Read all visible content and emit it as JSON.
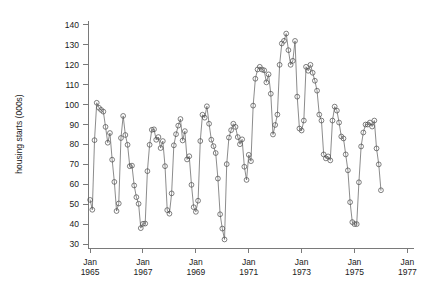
{
  "chart_data": {
    "type": "line",
    "title": "",
    "xlabel": "",
    "ylabel": "housing starts (000s)",
    "ylim": [
      28,
      142
    ],
    "yticks": [
      30,
      40,
      50,
      60,
      70,
      80,
      90,
      100,
      110,
      120,
      130,
      140
    ],
    "ytick_labels": [
      "30",
      "40",
      "50",
      "60",
      "70",
      "80",
      "90",
      "100",
      "110",
      "120",
      "130",
      "140"
    ],
    "xlim": [
      1964.92,
      1977.25
    ],
    "xticks": [
      1965.0,
      1967.0,
      1969.0,
      1971.0,
      1973.0,
      1975.0,
      1977.0
    ],
    "xtick_labels": [
      [
        "Jan",
        "1965"
      ],
      [
        "Jan",
        "1967"
      ],
      [
        "Jan",
        "1969"
      ],
      [
        "Jan",
        "1971"
      ],
      [
        "Jan",
        "1973"
      ],
      [
        "Jan",
        "1975"
      ],
      [
        "Jan",
        "1977"
      ]
    ],
    "grid": false,
    "legend": null,
    "marker": "open-circle",
    "marker_size": 2.4,
    "line_color": "#6e6e6e",
    "marker_color": "#4a4a4a",
    "axis_color": "#7a7a7a",
    "frequency": "monthly",
    "x_start": 1965.0,
    "x_step": 0.0833333,
    "series": [
      {
        "name": "housing starts",
        "values": [
          52.149,
          47.205,
          82.15,
          100.931,
          98.408,
          97.351,
          96.489,
          88.83,
          80.876,
          85.75,
          72.351,
          61.198,
          46.561,
          50.361,
          83.236,
          94.343,
          84.748,
          79.828,
          69.068,
          69.362,
          59.404,
          53.53,
          50.212,
          37.972,
          40.157,
          40.274,
          66.592,
          79.839,
          87.341,
          87.594,
          82.344,
          83.712,
          78.194,
          81.704,
          69.088,
          47.026,
          45.234,
          55.431,
          79.568,
          85.156,
          89.457,
          92.778,
          82.006,
          86.69,
          72.475,
          74.079,
          59.718,
          48.489,
          46.164,
          51.751,
          81.725,
          94.934,
          93.456,
          99.17,
          90.392,
          82.387,
          79.159,
          75.693,
          62.873,
          44.94,
          37.758,
          32.293,
          70.125,
          83.463,
          87.182,
          90.405,
          88.81,
          83.706,
          80.116,
          82.565,
          68.808,
          62.182,
          74.773,
          71.606,
          99.5,
          113.0,
          117.66,
          119.0,
          117.62,
          117.22,
          111.18,
          115.2,
          105.47,
          85.0,
          89.797,
          95.0,
          120.0,
          130.7,
          132.05,
          135.68,
          127.36,
          120.0,
          122.0,
          132.0,
          104.0,
          88.0,
          87.0,
          92.0,
          119.0,
          117.0,
          120.0,
          116.0,
          112.0,
          107.0,
          95.0,
          92.0,
          75.0,
          73.0,
          74.0,
          72.0,
          92.0,
          99.0,
          97.0,
          91.0,
          84.0,
          83.0,
          75.0,
          67.0,
          51.0,
          41.0,
          40.0,
          40.0,
          61.0,
          79.0,
          86.0,
          90.0,
          90.0,
          91.0,
          89.0,
          92.0,
          78.0,
          70.0,
          57.0
        ]
      }
    ]
  },
  "axis": {
    "y_title": "housing starts (000s)"
  }
}
